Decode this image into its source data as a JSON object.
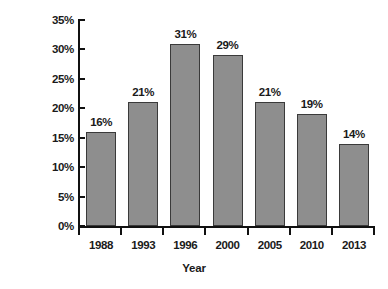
{
  "chart_data": {
    "type": "bar",
    "title": "",
    "xlabel": "Year",
    "ylabel": "% of covered employees",
    "categories": [
      "1988",
      "1993",
      "1996",
      "2000",
      "2005",
      "2010",
      "2013"
    ],
    "values": [
      16,
      21,
      31,
      29,
      21,
      19,
      14
    ],
    "value_labels": [
      "16%",
      "21%",
      "31%",
      "29%",
      "21%",
      "19%",
      "14%"
    ],
    "ylim": [
      0,
      35
    ],
    "ytick_labels": [
      "0%",
      "5%",
      "10%",
      "15%",
      "20%",
      "25%",
      "30%",
      "35%"
    ],
    "ytick_values": [
      0,
      5,
      10,
      15,
      20,
      25,
      30,
      35
    ],
    "grid": false,
    "legend": "none",
    "bar_fill_color": "#8e8e8e",
    "bar_border_color": "#3a3a3a",
    "axis_color": "#111111",
    "text_color": "#1a1a1a",
    "background_color": "#ffffff"
  }
}
